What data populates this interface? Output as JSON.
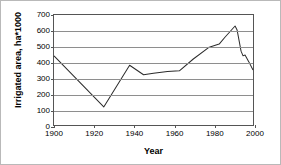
{
  "chart_data": {
    "type": "line",
    "title": "",
    "xlabel": "Year",
    "ylabel": "Irrigated area, ha*1000",
    "xlim": [
      1900,
      2000
    ],
    "ylim": [
      0,
      700
    ],
    "xticks": [
      1900,
      1920,
      1940,
      1960,
      1980,
      2000
    ],
    "yticks": [
      0,
      100,
      200,
      300,
      400,
      500,
      600,
      700
    ],
    "grid": "horizontal",
    "legend": "none",
    "line_color": "#2b2b2b",
    "grid_color": "#8e8e8e",
    "axis_color": "#555555",
    "series": [
      {
        "name": "Irrigated area",
        "x": [
          1900,
          1925,
          1938,
          1945,
          1950,
          1957,
          1963,
          1970,
          1978,
          1983,
          1986,
          1991,
          1992,
          1994,
          1995,
          1996,
          1998,
          2000
        ],
        "values": [
          440,
          115,
          380,
          320,
          330,
          340,
          345,
          420,
          495,
          515,
          560,
          630,
          605,
          470,
          440,
          445,
          400,
          350
        ]
      }
    ]
  }
}
